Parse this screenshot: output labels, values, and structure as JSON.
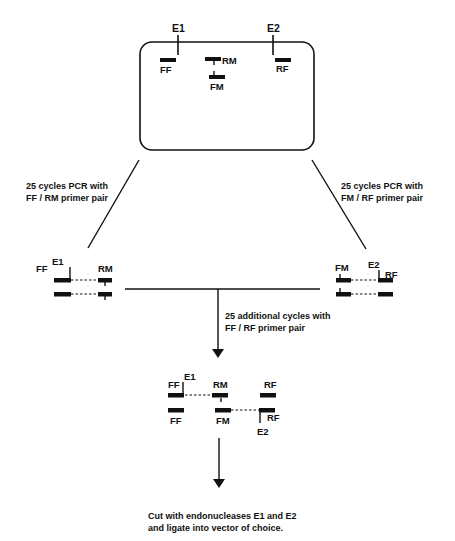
{
  "colors": {
    "ink": "#111111",
    "background": "#ffffff"
  },
  "template": {
    "restriction_sites": [
      "E1",
      "E2"
    ],
    "primers": {
      "ff": "FF",
      "rm": "RM",
      "fm": "FM",
      "rf": "RF"
    }
  },
  "steps": {
    "left_pcr": {
      "line1": "25 cycles PCR with",
      "line2": "FF / RM primer pair"
    },
    "right_pcr": {
      "line1": "25 cycles PCR with",
      "line2": "FM / RF primer pair"
    },
    "combined_pcr": {
      "line1": "25 additional cycles with",
      "line2": "FF / RF primer pair"
    },
    "final": {
      "line1": "Cut with endonucleases E1 and E2",
      "line2": "and ligate into vector of choice."
    }
  },
  "left_product": {
    "site": "E1",
    "primer_left": "FF",
    "primer_right": "RM"
  },
  "right_product": {
    "site": "E2",
    "primer_left": "FM",
    "primer_right": "RF"
  },
  "combined_product": {
    "top": {
      "site": "E1",
      "primer_left": "FF",
      "primer_mid": "RM",
      "primer_right": "RF"
    },
    "bottom": {
      "site": "E2",
      "primer_left": "FF",
      "primer_mid": "FM",
      "primer_right": "RF"
    }
  }
}
